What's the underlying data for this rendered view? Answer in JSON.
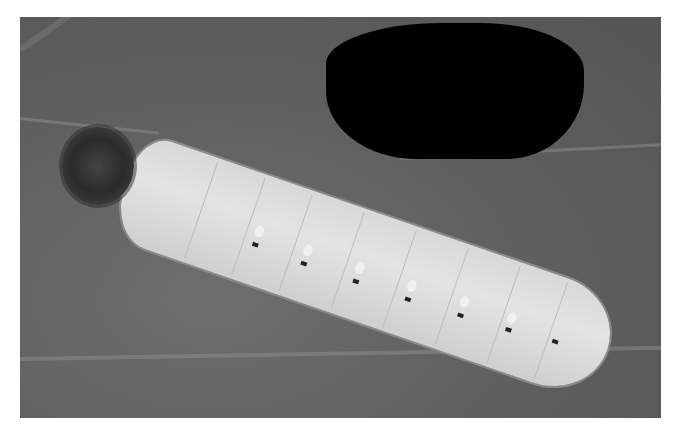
{
  "image": {
    "description": "Grayscale photograph of a pale, segmented caterpillar with a spiny dark head lying diagonally across a veined leaf; a black irregular blob covers the upper right area",
    "subjects": [
      "caterpillar",
      "leaf",
      "black-blob"
    ],
    "colors": {
      "leaf": "#5e5e5e",
      "caterpillar": "#dcdcdc",
      "blob": "#000000",
      "background": "#ffffff"
    }
  }
}
